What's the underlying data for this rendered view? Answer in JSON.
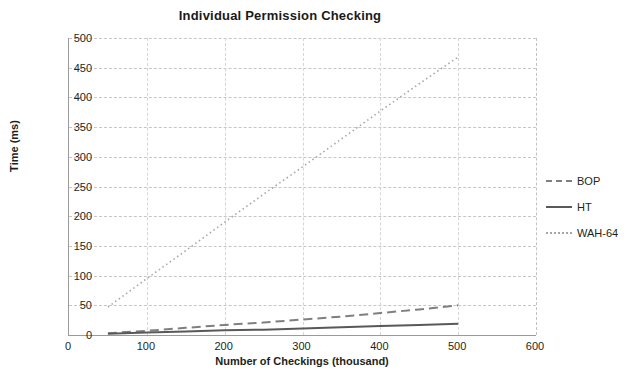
{
  "chart_data": {
    "type": "line",
    "title": "Individual Permission Checking",
    "xlabel": "Number of Checkings (thousand)",
    "ylabel": "Time (ms)",
    "xlim": [
      0,
      600
    ],
    "ylim": [
      0,
      500
    ],
    "xticks": [
      "0",
      "100",
      "200",
      "300",
      "400",
      "500",
      "600"
    ],
    "yticks": [
      "0",
      "50",
      "100",
      "150",
      "200",
      "250",
      "300",
      "350",
      "400",
      "450",
      "500"
    ],
    "grid": "horizontal-dashed-and-vertical-dashed",
    "legend_position": "right",
    "series": [
      {
        "name": "BOP",
        "color": "#7f7f7f",
        "style": "dashed",
        "x": [
          50,
          100,
          150,
          200,
          250,
          300,
          350,
          400,
          450,
          500
        ],
        "values": [
          3,
          7,
          12,
          17,
          21,
          26,
          31,
          37,
          43,
          50
        ]
      },
      {
        "name": "HT",
        "color": "#595959",
        "style": "solid",
        "x": [
          50,
          100,
          150,
          200,
          250,
          300,
          350,
          400,
          450,
          500
        ],
        "values": [
          2,
          4,
          6,
          8,
          9,
          11,
          13,
          15,
          17,
          19
        ]
      },
      {
        "name": "WAH-64",
        "color": "#a6a6a6",
        "style": "dotted",
        "x": [
          50,
          100,
          150,
          200,
          250,
          300,
          350,
          400,
          450,
          500
        ],
        "values": [
          47,
          95,
          142,
          190,
          237,
          283,
          330,
          377,
          423,
          468
        ]
      }
    ]
  },
  "legend": {
    "items": [
      {
        "label": "BOP"
      },
      {
        "label": "HT"
      },
      {
        "label": "WAH-64"
      }
    ]
  }
}
